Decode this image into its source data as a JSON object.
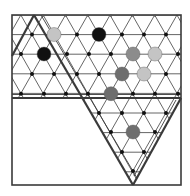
{
  "diagram": {
    "frame": {
      "x1": 12,
      "y1": 15,
      "x2": 181,
      "y2": 185
    },
    "divider_y": 99,
    "colors": {
      "line": "#3a3a3a",
      "grid": "#555555",
      "node": "#111111",
      "black": "#111111",
      "dark_gray": "#6e6e6e",
      "mid_gray": "#8c8c8c",
      "light_gray": "#c4c4c4"
    },
    "stones": [
      {
        "x": 54,
        "y": 34.5,
        "r": 7,
        "color": "light_gray"
      },
      {
        "x": 99,
        "y": 34.5,
        "r": 7,
        "color": "black"
      },
      {
        "x": 44,
        "y": 54,
        "r": 7,
        "color": "black"
      },
      {
        "x": 133,
        "y": 54,
        "r": 7,
        "color": "mid_gray"
      },
      {
        "x": 155,
        "y": 54,
        "r": 7,
        "color": "light_gray"
      },
      {
        "x": 122,
        "y": 74,
        "r": 7,
        "color": "dark_gray"
      },
      {
        "x": 144,
        "y": 74,
        "r": 7,
        "color": "light_gray"
      },
      {
        "x": 111,
        "y": 93.7,
        "r": 7,
        "color": "dark_gray"
      },
      {
        "x": 133,
        "y": 132,
        "r": 7,
        "color": "dark_gray"
      }
    ]
  }
}
